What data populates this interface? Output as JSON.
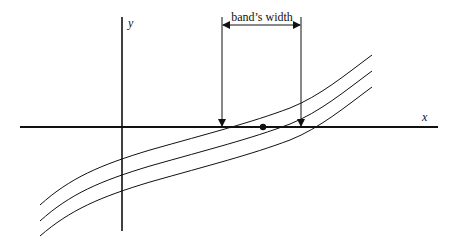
{
  "diagram": {
    "type": "function-band-illustration",
    "axes": {
      "x_label": "x",
      "y_label": "y"
    },
    "annotation": {
      "label": "band’s width",
      "arrow": "double-headed horizontal",
      "marks_points": "left and right intersections of outer curves with x-axis"
    },
    "curves": [
      {
        "name": "upper-curve"
      },
      {
        "name": "middle-curve"
      },
      {
        "name": "lower-curve"
      }
    ],
    "root_point": {
      "name": "middle-curve-root",
      "description": "filled dot where middle curve crosses x-axis"
    },
    "colors": {
      "line": "#111111",
      "background": "#ffffff"
    }
  }
}
